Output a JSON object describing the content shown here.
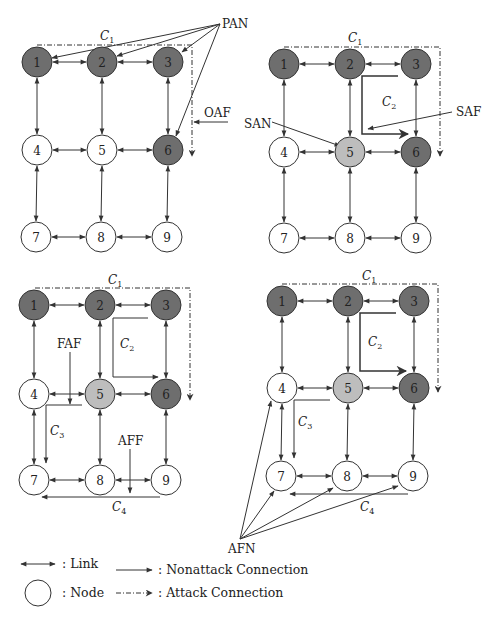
{
  "figure": {
    "colors": {
      "compromised_node": "#6e6e6e",
      "suspicious_node": "#bdbdbd",
      "normal_node": "#ffffff",
      "stroke": "#333333"
    },
    "panels": [
      {
        "id": "panel-1",
        "nodes": [
          {
            "label": "1",
            "x": 37,
            "y": 62,
            "state": "compromised"
          },
          {
            "label": "2",
            "x": 102,
            "y": 62,
            "state": "compromised"
          },
          {
            "label": "3",
            "x": 168,
            "y": 62,
            "state": "compromised"
          },
          {
            "label": "4",
            "x": 37,
            "y": 150,
            "state": "normal"
          },
          {
            "label": "5",
            "x": 102,
            "y": 150,
            "state": "normal"
          },
          {
            "label": "6",
            "x": 168,
            "y": 150,
            "state": "compromised"
          },
          {
            "label": "7",
            "x": 36,
            "y": 237,
            "state": "normal"
          },
          {
            "label": "8",
            "x": 101,
            "y": 237,
            "state": "normal"
          },
          {
            "label": "9",
            "x": 167,
            "y": 237,
            "state": "normal"
          }
        ],
        "connection_labels": [
          {
            "name": "C",
            "sub": "1",
            "x": 100,
            "y": 40
          }
        ],
        "annotations": [
          {
            "text": "PAN",
            "x": 222,
            "y": 28
          },
          {
            "text": "OAF",
            "x": 204,
            "y": 117
          }
        ]
      },
      {
        "id": "panel-2",
        "nodes": [
          {
            "label": "1",
            "x": 284,
            "y": 64,
            "state": "compromised"
          },
          {
            "label": "2",
            "x": 350,
            "y": 64,
            "state": "compromised"
          },
          {
            "label": "3",
            "x": 416,
            "y": 64,
            "state": "compromised"
          },
          {
            "label": "4",
            "x": 284,
            "y": 152,
            "state": "normal"
          },
          {
            "label": "5",
            "x": 350,
            "y": 152,
            "state": "suspicious"
          },
          {
            "label": "6",
            "x": 416,
            "y": 152,
            "state": "compromised"
          },
          {
            "label": "7",
            "x": 284,
            "y": 238,
            "state": "normal"
          },
          {
            "label": "8",
            "x": 350,
            "y": 238,
            "state": "normal"
          },
          {
            "label": "9",
            "x": 416,
            "y": 238,
            "state": "normal"
          }
        ],
        "connection_labels": [
          {
            "name": "C",
            "sub": "1",
            "x": 348,
            "y": 42
          },
          {
            "name": "C",
            "sub": "2",
            "x": 382,
            "y": 106
          }
        ],
        "annotations": [
          {
            "text": "SAN",
            "x": 244,
            "y": 128
          },
          {
            "text": "SAF",
            "x": 456,
            "y": 116
          }
        ]
      },
      {
        "id": "panel-3",
        "nodes": [
          {
            "label": "1",
            "x": 34,
            "y": 305,
            "state": "compromised"
          },
          {
            "label": "2",
            "x": 100,
            "y": 305,
            "state": "compromised"
          },
          {
            "label": "3",
            "x": 166,
            "y": 305,
            "state": "compromised"
          },
          {
            "label": "4",
            "x": 34,
            "y": 394,
            "state": "normal"
          },
          {
            "label": "5",
            "x": 100,
            "y": 394,
            "state": "suspicious"
          },
          {
            "label": "6",
            "x": 166,
            "y": 394,
            "state": "compromised"
          },
          {
            "label": "7",
            "x": 34,
            "y": 480,
            "state": "normal"
          },
          {
            "label": "8",
            "x": 100,
            "y": 480,
            "state": "normal"
          },
          {
            "label": "9",
            "x": 166,
            "y": 480,
            "state": "normal"
          }
        ],
        "connection_labels": [
          {
            "name": "C",
            "sub": "1",
            "x": 108,
            "y": 284
          },
          {
            "name": "C",
            "sub": "2",
            "x": 120,
            "y": 348
          },
          {
            "name": "C",
            "sub": "3",
            "x": 50,
            "y": 435
          },
          {
            "name": "C",
            "sub": "4",
            "x": 112,
            "y": 511
          }
        ],
        "annotations": [
          {
            "text": "FAF",
            "x": 57,
            "y": 348
          },
          {
            "text": "AFF",
            "x": 118,
            "y": 445
          }
        ]
      },
      {
        "id": "panel-4",
        "nodes": [
          {
            "label": "1",
            "x": 282,
            "y": 301,
            "state": "compromised"
          },
          {
            "label": "2",
            "x": 348,
            "y": 301,
            "state": "compromised"
          },
          {
            "label": "3",
            "x": 414,
            "y": 301,
            "state": "compromised"
          },
          {
            "label": "4",
            "x": 282,
            "y": 388,
            "state": "normal"
          },
          {
            "label": "5",
            "x": 348,
            "y": 388,
            "state": "suspicious"
          },
          {
            "label": "6",
            "x": 414,
            "y": 388,
            "state": "compromised"
          },
          {
            "label": "7",
            "x": 281,
            "y": 476,
            "state": "normal"
          },
          {
            "label": "8",
            "x": 347,
            "y": 476,
            "state": "normal"
          },
          {
            "label": "9",
            "x": 413,
            "y": 476,
            "state": "normal"
          }
        ],
        "connection_labels": [
          {
            "name": "C",
            "sub": "1",
            "x": 362,
            "y": 280
          },
          {
            "name": "C",
            "sub": "2",
            "x": 368,
            "y": 346
          },
          {
            "name": "C",
            "sub": "3",
            "x": 298,
            "y": 426
          },
          {
            "name": "C",
            "sub": "4",
            "x": 360,
            "y": 511
          }
        ],
        "annotations": [
          {
            "text": "AFN",
            "x": 228,
            "y": 553
          }
        ]
      }
    ],
    "legend": {
      "link_label": ": Link",
      "node_label": ": Node",
      "nonattack_label": ": Nonattack Connection",
      "attack_label": ": Attack Connection"
    }
  }
}
